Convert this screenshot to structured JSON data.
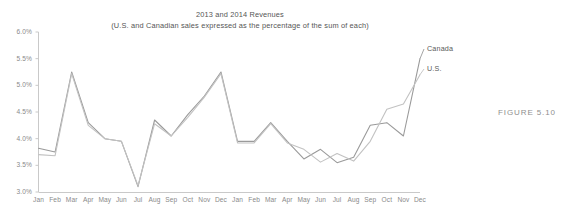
{
  "figure": {
    "caption": "FIGURE 5.10"
  },
  "chart_data": {
    "type": "line",
    "title": "2013 and 2014 Revenues",
    "subtitle": "(U.S. and Canadian sales expressed as the percentage of the sum of each)",
    "xlabel": "",
    "ylabel": "",
    "ylim": [
      3.0,
      6.0
    ],
    "ytick_labels": [
      "6.0%",
      "5.5%",
      "5.0%",
      "4.5%",
      "4.0%",
      "3.5%",
      "3.0%"
    ],
    "ytick_values": [
      6.0,
      5.5,
      5.0,
      4.5,
      4.0,
      3.5,
      3.0
    ],
    "grid": false,
    "legend_position": "right-end-of-line",
    "categories": [
      "Jan",
      "Feb",
      "Mar",
      "Apr",
      "May",
      "Jun",
      "Jul",
      "Aug",
      "Sep",
      "Oct",
      "Nov",
      "Dec",
      "Jan",
      "Feb",
      "Mar",
      "Apr",
      "May",
      "Jun",
      "Jul",
      "Aug",
      "Sep",
      "Oct",
      "Nov",
      "Dec"
    ],
    "series": [
      {
        "name": "Canada",
        "color": "#9a9a9a",
        "values": [
          3.82,
          3.75,
          5.25,
          4.3,
          4.0,
          3.95,
          3.1,
          4.35,
          4.05,
          4.45,
          4.8,
          5.25,
          3.95,
          3.95,
          4.3,
          3.95,
          3.62,
          3.8,
          3.55,
          3.65,
          4.25,
          4.3,
          4.05,
          5.5
        ]
      },
      {
        "name": "U.S.",
        "color": "#c2c2c2",
        "values": [
          3.7,
          3.68,
          5.22,
          4.25,
          4.0,
          3.95,
          3.12,
          4.28,
          4.05,
          4.4,
          4.78,
          5.22,
          3.92,
          3.92,
          4.28,
          3.92,
          3.8,
          3.56,
          3.72,
          3.58,
          3.95,
          4.55,
          4.65,
          5.2
        ]
      }
    ]
  }
}
